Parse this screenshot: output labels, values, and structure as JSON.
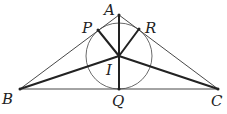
{
  "diagram": {
    "points": {
      "A": {
        "label": "A",
        "x": 119,
        "y": 15,
        "lx": 104,
        "ly": 15
      },
      "B": {
        "label": "B",
        "x": 20,
        "y": 89,
        "lx": 2,
        "ly": 104
      },
      "C": {
        "label": "C",
        "x": 218,
        "y": 89,
        "lx": 211,
        "ly": 106
      },
      "P": {
        "label": "P",
        "x": 98,
        "y": 30,
        "lx": 82,
        "ly": 33
      },
      "R": {
        "label": "R",
        "x": 139,
        "y": 29,
        "lx": 145,
        "ly": 33
      },
      "I": {
        "label": "I",
        "x": 119,
        "y": 56,
        "lx": 106,
        "ly": 75
      },
      "Q": {
        "label": "Q",
        "x": 119,
        "y": 89,
        "lx": 112,
        "ly": 106
      }
    },
    "incircle": {
      "cx": 119,
      "cy": 56,
      "r": 33
    },
    "colors": {
      "stroke": "#333333",
      "thick": "#222222"
    }
  }
}
